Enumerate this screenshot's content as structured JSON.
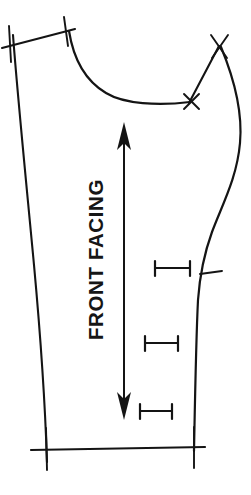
{
  "figure": {
    "kind": "sewing-pattern-piece",
    "medium": "scanned line drawing",
    "background_color": "#ffffff",
    "ink_color": "#141414",
    "title": "FRONT FACING",
    "grainline_label": "FRONT FACING",
    "caption": "",
    "caption_visible": false,
    "caption_note": "caption text is cropped off the bottom edge of the image",
    "markings": {
      "grainline": {
        "name": "grainline-arrow",
        "style": "double-headed vertical arrow",
        "direction": "both",
        "top_y": 124,
        "bottom_y": 418
      },
      "ibars": [
        {
          "label": "",
          "y": 268,
          "x_start": 131,
          "x_end": 186
        },
        {
          "label": "",
          "y": 343,
          "x_start": 122,
          "x_end": 178
        },
        {
          "label": "",
          "y": 411,
          "x_start": 133,
          "x_end": 172
        }
      ],
      "notches": [
        {
          "name": "notch-x-top-right",
          "shape": "X",
          "x": 219,
          "y": 45
        },
        {
          "name": "notch-x-dart-point",
          "shape": "X",
          "x": 192,
          "y": 101
        },
        {
          "name": "notch-tick-right-seam",
          "shape": "tick",
          "x": 213,
          "y": 274
        },
        {
          "name": "notch-cross-top-left-a",
          "shape": "cross",
          "x": 10,
          "y": 44
        },
        {
          "name": "notch-cross-top-left-b",
          "shape": "cross",
          "x": 65,
          "y": 31
        },
        {
          "name": "notch-cross-bottom-left",
          "shape": "cross",
          "x": 47,
          "y": 450
        },
        {
          "name": "notch-cross-bottom-right",
          "shape": "cross",
          "x": 194,
          "y": 450
        }
      ],
      "edges": [
        {
          "name": "top-shoulder-edge",
          "type": "straight"
        },
        {
          "name": "neckline-curve",
          "type": "concave curve"
        },
        {
          "name": "dart-v-notch",
          "type": "v-shaped dart"
        },
        {
          "name": "right-side-seam",
          "type": "s-curve"
        },
        {
          "name": "left-center-front-edge",
          "type": "near-straight slant"
        },
        {
          "name": "bottom-hem-edge",
          "type": "straight"
        }
      ]
    }
  }
}
